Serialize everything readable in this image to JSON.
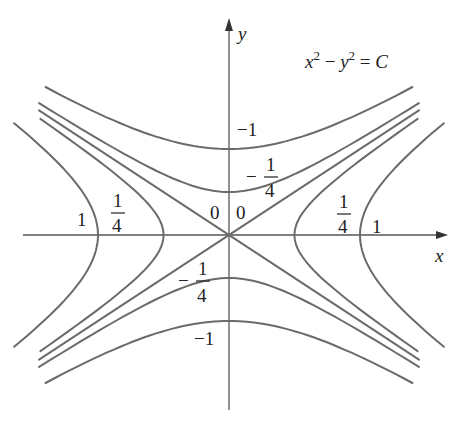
{
  "figure": {
    "equation": {
      "x": "x",
      "xexp": "2",
      "minus": " − ",
      "y": "y",
      "yexp": "2",
      "eq": " = ",
      "c": "C"
    },
    "axes": {
      "x_label": "x",
      "y_label": "y"
    },
    "origin_px": [
      229,
      235
    ],
    "scale_px": {
      "x": 131,
      "y": 86
    },
    "colors": {
      "curve": "#6b6b6b",
      "axis": "#555555",
      "text": "#222222"
    },
    "level_sets": [
      {
        "C": 1,
        "type": "hyperbola-horizontal"
      },
      {
        "C": 0.25,
        "type": "hyperbola-horizontal"
      },
      {
        "C": 0,
        "type": "asymptote-lines"
      },
      {
        "C": -0.25,
        "type": "hyperbola-vertical"
      },
      {
        "C": -1,
        "type": "hyperbola-vertical"
      }
    ],
    "labels": {
      "left_one": "1",
      "left_quarter_num": "1",
      "left_quarter_den": "4",
      "right_one": "1",
      "right_quarter_num": "1",
      "right_quarter_den": "4",
      "zero_left": "0",
      "zero_right": "0",
      "top_neg_one": "−1",
      "top_neg_quarter_sign": "−",
      "top_neg_quarter_num": "1",
      "top_neg_quarter_den": "4",
      "bottom_neg_one": "−1",
      "bottom_neg_quarter_sign": "−",
      "bottom_neg_quarter_num": "1",
      "bottom_neg_quarter_den": "4"
    }
  }
}
